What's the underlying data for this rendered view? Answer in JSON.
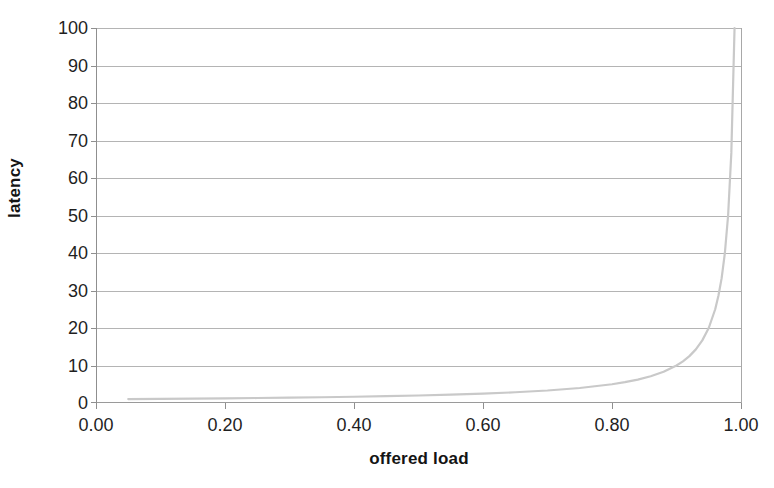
{
  "chart_data": {
    "type": "line",
    "title": "",
    "xlabel": "offered load",
    "ylabel": "latency",
    "xlim": [
      0.0,
      1.0
    ],
    "ylim": [
      0,
      100
    ],
    "grid": "horizontal",
    "legend": "none",
    "line_color": "#c9c9c9",
    "gridline_color": "#b4b4b4",
    "axis_color": "#8f8f8f",
    "text_color": "#1f1f1f",
    "xticks": [
      "0.00",
      "0.20",
      "0.40",
      "0.60",
      "0.80",
      "1.00"
    ],
    "xtick_values": [
      0.0,
      0.2,
      0.4,
      0.6,
      0.8,
      1.0
    ],
    "yticks": [
      "0",
      "10",
      "20",
      "30",
      "40",
      "50",
      "60",
      "70",
      "80",
      "90",
      "100"
    ],
    "ytick_values": [
      0,
      10,
      20,
      30,
      40,
      50,
      60,
      70,
      80,
      90,
      100
    ],
    "series": [
      {
        "name": "latency vs offered load",
        "formula": "latency = 1 / (1 - offered_load)",
        "x": [
          0.05,
          0.1,
          0.15,
          0.2,
          0.25,
          0.3,
          0.35,
          0.4,
          0.45,
          0.5,
          0.55,
          0.6,
          0.65,
          0.7,
          0.75,
          0.8,
          0.82,
          0.84,
          0.86,
          0.88,
          0.9,
          0.91,
          0.92,
          0.93,
          0.94,
          0.95,
          0.96,
          0.965,
          0.97,
          0.975,
          0.98,
          0.985,
          0.99
        ],
        "y": [
          1.05,
          1.11,
          1.18,
          1.25,
          1.33,
          1.43,
          1.54,
          1.67,
          1.82,
          2.0,
          2.22,
          2.5,
          2.86,
          3.33,
          4.0,
          5.0,
          5.56,
          6.25,
          7.14,
          8.33,
          10.0,
          11.1,
          12.5,
          14.3,
          16.7,
          20.0,
          25.0,
          28.6,
          33.3,
          40.0,
          50.0,
          66.7,
          100.0
        ]
      }
    ]
  },
  "labels": {
    "y_axis_title": "latency",
    "x_axis_title": "offered load"
  }
}
